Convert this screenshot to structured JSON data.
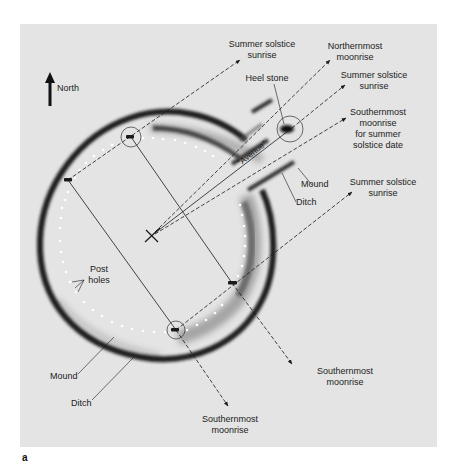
{
  "figure": {
    "panel_letter": "a",
    "background_color": "#e4e4e4",
    "ink_color": "#1a1a1a"
  },
  "compass": {
    "label": "North",
    "icon": "north-arrow-icon"
  },
  "labels": {
    "summer_solstice_sunrise_top": [
      "Summer solstice",
      "sunrise"
    ],
    "northernmost_moonrise": [
      "Northernmost",
      "moonrise"
    ],
    "heel_stone": "Heel stone",
    "summer_solstice_sunrise_mid": [
      "Summer solstice",
      "sunrise"
    ],
    "southernmost_moonrise_summer": [
      "Southernmost",
      "moonrise",
      "for summer",
      "solstice date"
    ],
    "avenue": "\"Avenue\"",
    "mound_right": "Mound",
    "ditch_right": "Ditch",
    "summer_solstice_sunrise_right": [
      "Summer solstice",
      "sunrise"
    ],
    "post_holes": [
      "Post",
      "holes"
    ],
    "mound_left": "Mound",
    "ditch_left": "Ditch",
    "southernmost_moonrise_right": [
      "Southernmost",
      "moonrise"
    ],
    "southernmost_moonrise_bottom": [
      "Southernmost",
      "moonrise"
    ]
  }
}
